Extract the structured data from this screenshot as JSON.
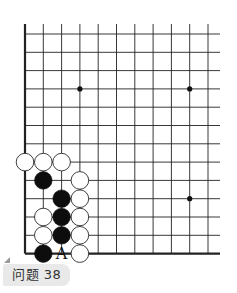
{
  "caption": {
    "label": "问题 38"
  },
  "board": {
    "line_color": "#222222",
    "grid": {
      "origin_x": 25,
      "origin_y": 34,
      "spacing": 18.3,
      "cols": 11,
      "rows": 13,
      "h_line_extend_right": 220,
      "v_line_top": 24,
      "left_edge_thick": true,
      "bottom_edge_thick": true
    },
    "star_points": [
      {
        "col": 3,
        "row": 3
      },
      {
        "col": 9,
        "row": 3
      },
      {
        "col": 9,
        "row": 9
      }
    ],
    "stones": [
      {
        "color": "white",
        "col": 0,
        "row": 7
      },
      {
        "color": "white",
        "col": 1,
        "row": 7
      },
      {
        "color": "white",
        "col": 2,
        "row": 7
      },
      {
        "color": "black",
        "col": 1,
        "row": 8
      },
      {
        "color": "white",
        "col": 3,
        "row": 8
      },
      {
        "color": "black",
        "col": 2,
        "row": 9
      },
      {
        "color": "white",
        "col": 3,
        "row": 9
      },
      {
        "color": "white",
        "col": 1,
        "row": 10
      },
      {
        "color": "black",
        "col": 2,
        "row": 10
      },
      {
        "color": "white",
        "col": 3,
        "row": 10
      },
      {
        "color": "white",
        "col": 1,
        "row": 11
      },
      {
        "color": "black",
        "col": 2,
        "row": 11
      },
      {
        "color": "white",
        "col": 3,
        "row": 11
      },
      {
        "color": "black",
        "col": 1,
        "row": 12
      },
      {
        "color": "white",
        "col": 3,
        "row": 12
      }
    ],
    "markers": [
      {
        "label": "A",
        "col": 2,
        "row": 12
      }
    ]
  }
}
